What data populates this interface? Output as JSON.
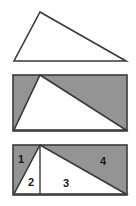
{
  "figure": {
    "title": "",
    "background_color": "#ffffff",
    "stroke_color": "#3a3a3a",
    "fill_gray": "#949494",
    "fill_white": "#ffffff",
    "panel_count": 3
  },
  "panels": [
    {
      "id": "panel-1",
      "name": "outlined-triangle",
      "description": "Triangle outline only, no fill",
      "shapes": [
        {
          "type": "triangle",
          "fill": "#ffffff",
          "stroke": "#3a3a3a",
          "points": "40,12 126,61 14,61"
        }
      ],
      "labels": []
    },
    {
      "id": "panel-2",
      "name": "triangle-in-rectangle",
      "description": "Gray rectangle with white triangle inscribed",
      "shapes": [
        {
          "type": "rect",
          "fill": "#949494",
          "stroke": "#3a3a3a",
          "x": 13,
          "y": 5,
          "width": 114,
          "height": 56
        },
        {
          "type": "triangle",
          "fill": "#ffffff",
          "stroke": "#3a3a3a",
          "points": "40,5 126,60 14,60"
        }
      ],
      "labels": []
    },
    {
      "id": "panel-3",
      "name": "partitioned-rectangle",
      "description": "Gray rectangle partitioned into four numbered regions by the triangle edges and a vertical line from the apex",
      "shapes": [
        {
          "type": "rect",
          "fill": "#949494",
          "stroke": "#3a3a3a",
          "x": 13,
          "y": 7,
          "width": 114,
          "height": 50
        },
        {
          "type": "triangle",
          "fill": "#ffffff",
          "stroke": "#3a3a3a",
          "points": "40,7 126,56 14,56"
        },
        {
          "type": "line",
          "stroke": "#3a3a3a",
          "x1": 40,
          "y1": 7,
          "x2": 40,
          "y2": 56
        }
      ],
      "labels": [
        {
          "text": "1",
          "x": 21,
          "y": 25,
          "region": "upper-left-gray"
        },
        {
          "text": "2",
          "x": 31,
          "y": 48,
          "region": "left-white"
        },
        {
          "text": "3",
          "x": 66,
          "y": 49,
          "region": "center-white"
        },
        {
          "text": "4",
          "x": 103,
          "y": 27,
          "region": "upper-right-gray"
        }
      ]
    }
  ]
}
